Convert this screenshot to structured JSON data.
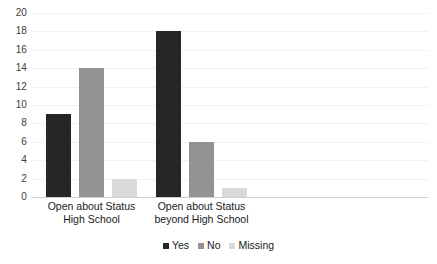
{
  "chart_data": {
    "type": "bar",
    "title": "",
    "subtitle": "",
    "xlabel": "",
    "ylabel": "",
    "categories": [
      "Open about Status High School",
      "Open about Status beyond High School"
    ],
    "category_lines": [
      [
        "Open about Status",
        "High School"
      ],
      [
        "Open about Status",
        "beyond High School"
      ]
    ],
    "series": [
      {
        "name": "Yes",
        "values": [
          9,
          18
        ],
        "color": "#262626"
      },
      {
        "name": "No",
        "values": [
          14,
          6
        ],
        "color": "#939393"
      },
      {
        "name": "Missing",
        "values": [
          2,
          1
        ],
        "color": "#d9d9d9"
      }
    ],
    "ylim": [
      0,
      20
    ],
    "ytick_step": 2,
    "yticks": [
      "20",
      "18",
      "16",
      "14",
      "12",
      "10",
      "8",
      "6",
      "4",
      "2",
      "0"
    ],
    "ytick_values": [
      20,
      18,
      16,
      14,
      12,
      10,
      8,
      6,
      4,
      2,
      0
    ],
    "grid": true,
    "grid_color": "#f2f2f2",
    "legend_position": "bottom",
    "legend_entries": [
      "Yes",
      "No",
      "Missing"
    ],
    "background": "#ffffff",
    "axis_text_color": "#404040",
    "label_text_color": "#1a1a1a"
  }
}
